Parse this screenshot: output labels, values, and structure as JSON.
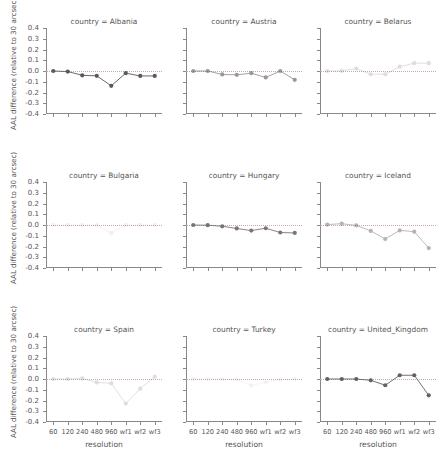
{
  "chart_data": {
    "type": "line",
    "title": "",
    "xlabel": "resolution",
    "ylabel": "AAL difference (relative to 30 arcsec)",
    "categories": [
      "60",
      "120",
      "240",
      "480",
      "960",
      "wf1",
      "wf2",
      "wf3"
    ],
    "ylim": [
      -0.4,
      0.4
    ],
    "yticks": [
      "0.4",
      "0.3",
      "0.2",
      "0.1",
      "0.0",
      "-0.1",
      "-0.2",
      "-0.3",
      "-0.4"
    ],
    "ytick_values": [
      0.4,
      0.3,
      0.2,
      0.1,
      0.0,
      -0.1,
      -0.2,
      -0.3,
      -0.4
    ],
    "grid": false,
    "legend": "none",
    "reference_line": 0.0,
    "marker": "circle",
    "facet_variable": "country",
    "panels": [
      {
        "title": "country = Albania",
        "country": "Albania",
        "opacity": 1.0,
        "values": [
          0.0,
          -0.005,
          -0.04,
          -0.045,
          -0.138,
          -0.02,
          -0.046,
          -0.046
        ]
      },
      {
        "title": "country = Austria",
        "country": "Austria",
        "opacity": 0.62,
        "values": [
          0.0,
          0.0,
          -0.032,
          -0.036,
          -0.02,
          -0.06,
          0.0,
          -0.082
        ]
      },
      {
        "title": "country = Belarus",
        "country": "Belarus",
        "opacity": 0.2,
        "values": [
          0.0,
          0.002,
          0.022,
          -0.03,
          -0.03,
          0.04,
          0.073,
          0.073
        ]
      },
      {
        "title": "country = Bulgaria",
        "country": "Bulgaria",
        "opacity": 0.09,
        "values": [
          0.0,
          0.0,
          0.0,
          0.0,
          -0.075,
          0.0,
          0.0,
          0.0
        ]
      },
      {
        "title": "country = Hungary",
        "country": "Hungary",
        "opacity": 0.82,
        "values": [
          0.0,
          -0.002,
          -0.012,
          -0.032,
          -0.052,
          -0.03,
          -0.07,
          -0.074
        ]
      },
      {
        "title": "country = Iceland",
        "country": "Iceland",
        "opacity": 0.45,
        "values": [
          0.004,
          0.012,
          -0.004,
          -0.055,
          -0.13,
          -0.05,
          -0.062,
          -0.215
        ]
      },
      {
        "title": "country = Spain",
        "country": "Spain",
        "opacity": 0.2,
        "values": [
          0.0,
          0.0,
          0.005,
          -0.032,
          -0.04,
          -0.228,
          -0.09,
          0.022
        ]
      },
      {
        "title": "country = Turkey",
        "country": "Turkey",
        "opacity": 0.07,
        "values": [
          0.0,
          0.0,
          0.0,
          -0.005,
          -0.06,
          -0.03,
          -0.005,
          0.0
        ]
      },
      {
        "title": "country = United_Kingdom",
        "country": "United_Kingdom",
        "opacity": 0.95,
        "values": [
          0.0,
          0.0,
          0.0,
          -0.012,
          -0.058,
          0.035,
          0.035,
          -0.152
        ]
      }
    ],
    "series_color": "#5a5a5a",
    "reference_line_color": "#c9a8a8",
    "axis_color": "#888888"
  }
}
